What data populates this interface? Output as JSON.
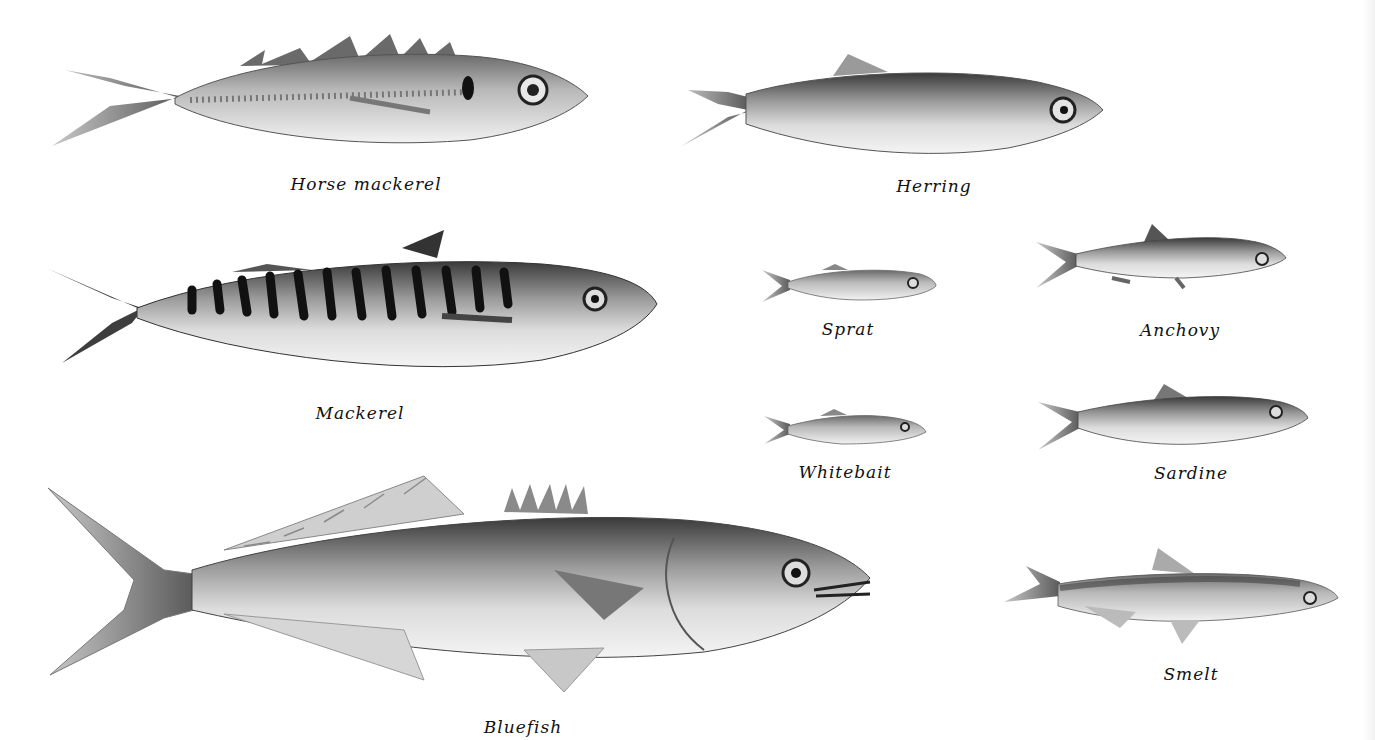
{
  "colors": {
    "background": "#ffffff",
    "ink": "#111111",
    "fish_dark": "#2a2a2a",
    "fish_mid": "#8a8a8a",
    "fish_light": "#eeeeee"
  },
  "fish": [
    {
      "id": "horse-mackerel",
      "label": "Horse mackerel",
      "label_x": 366,
      "label_y": 174
    },
    {
      "id": "herring",
      "label": "Herring",
      "label_x": 934,
      "label_y": 176
    },
    {
      "id": "mackerel",
      "label": "Mackerel",
      "label_x": 360,
      "label_y": 403
    },
    {
      "id": "sprat",
      "label": "Sprat",
      "label_x": 848,
      "label_y": 319
    },
    {
      "id": "anchovy",
      "label": "Anchovy",
      "label_x": 1180,
      "label_y": 320
    },
    {
      "id": "whitebait",
      "label": "Whitebait",
      "label_x": 845,
      "label_y": 462
    },
    {
      "id": "sardine",
      "label": "Sardine",
      "label_x": 1191,
      "label_y": 463
    },
    {
      "id": "bluefish",
      "label": "Bluefish",
      "label_x": 523,
      "label_y": 717
    },
    {
      "id": "smelt",
      "label": "Smelt",
      "label_x": 1191,
      "label_y": 664
    }
  ]
}
